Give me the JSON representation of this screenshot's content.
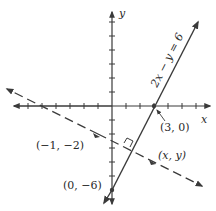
{
  "diagram": {
    "type": "coordinate-plane",
    "axes": {
      "x_label": "x",
      "y_label": "y",
      "origin_px": [
        112,
        106
      ],
      "unit_px": 14
    },
    "lines": [
      {
        "name": "solid-line",
        "equation": "2x − y = 6",
        "style": "solid"
      },
      {
        "name": "dashed-line",
        "style": "dashed",
        "perpendicular_to": "2x − y = 6",
        "through": "(−1, −2)"
      }
    ],
    "labels": {
      "equation": "2x − y = 6",
      "point_3_0": "(3, 0)",
      "point_neg1_neg2": "(−1, −2)",
      "point_x_y": "(x, y)",
      "point_0_neg6": "(0, −6)"
    },
    "colors": {
      "ink": "#3a3a3a",
      "background": "#ffffff"
    }
  }
}
